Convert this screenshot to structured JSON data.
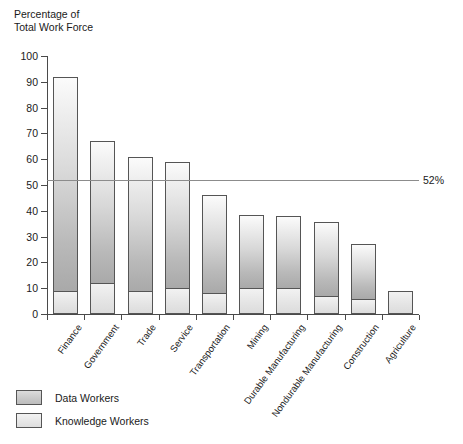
{
  "axis_title": "Percentage of\nTotal Work Force",
  "reference": {
    "label": "52%",
    "value": 52
  },
  "legend": {
    "items": [
      {
        "label": "Data Workers",
        "key": "data",
        "color": "#c9c9c9"
      },
      {
        "label": "Knowledge Workers",
        "key": "knowledge",
        "color": "#e6e6e6"
      }
    ]
  },
  "chart_data": {
    "type": "bar",
    "title": "",
    "subtitle": "",
    "xlabel": "",
    "ylabel": "Percentage of Total Work Force",
    "ylim": [
      0,
      100
    ],
    "ytick_step": 10,
    "yticks": [
      0,
      10,
      20,
      30,
      40,
      50,
      60,
      70,
      80,
      90,
      100
    ],
    "ytick_labels": [
      "0",
      "10",
      "20",
      "30",
      "40",
      "50",
      "60",
      "70",
      "80",
      "90",
      "100"
    ],
    "grid": false,
    "stacked": true,
    "legend_position": "bottom-left",
    "categories": [
      "Finance",
      "Government",
      "Trade",
      "Service",
      "Transportation",
      "Mining",
      "Durable Manufacturing",
      "Nondurable Manufacturing",
      "Construction",
      "Agriculture"
    ],
    "series": [
      {
        "name": "Knowledge Workers",
        "values": [
          9,
          12,
          9,
          10,
          8,
          10,
          10,
          7,
          6,
          9
        ]
      },
      {
        "name": "Data Workers",
        "values": [
          83,
          55,
          52,
          49,
          38,
          28.5,
          28,
          28.5,
          21,
          0
        ]
      }
    ],
    "totals": [
      92,
      67,
      61,
      59,
      46,
      38.5,
      38,
      35.5,
      27,
      9
    ],
    "annotations": [
      {
        "type": "hline",
        "value": 52,
        "label": "52%"
      }
    ]
  }
}
